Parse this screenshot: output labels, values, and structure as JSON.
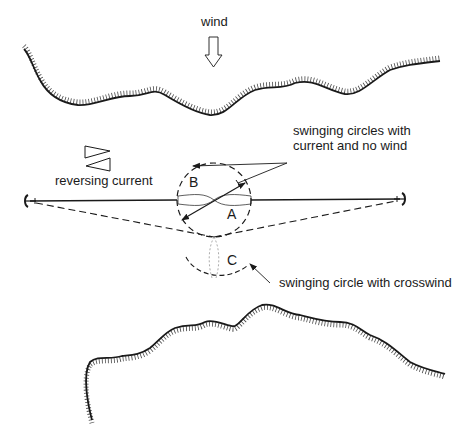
{
  "labels": {
    "wind": "wind",
    "reversing_current": "reversing current",
    "swinging_circles_line1": "swinging circles with",
    "swinging_circles_line2": "current and no wind",
    "swinging_crosswind": "swinging circle with crosswind"
  },
  "positions": {
    "A": "A",
    "B": "B",
    "C": "C"
  },
  "elements": {
    "upper_shore": "shoreline",
    "lower_shore": "shoreline",
    "left_anchor": "anchor",
    "right_anchor": "anchor",
    "wind_arrow": "down-arrow",
    "current_arrows": [
      "right-triangle",
      "left-triangle"
    ]
  },
  "colors": {
    "ink": "#1a1a1a",
    "background": "#ffffff"
  }
}
